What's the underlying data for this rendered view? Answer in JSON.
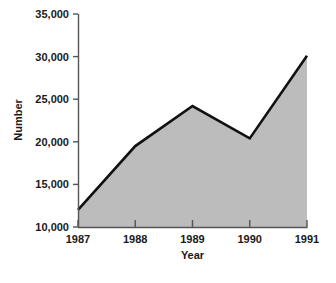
{
  "chart_data": {
    "type": "area",
    "title": "",
    "subtitle": "",
    "xlabel": "Year",
    "ylabel": "Number",
    "categories": [
      "1987",
      "1988",
      "1989",
      "1990",
      "1991"
    ],
    "x": [
      1987,
      1988,
      1989,
      1990,
      1991
    ],
    "values": [
      12000,
      19500,
      24200,
      20400,
      30100
    ],
    "series": [
      {
        "name": "Number",
        "values": [
          12000,
          19500,
          24200,
          20400,
          30100
        ]
      }
    ],
    "xlim": [
      1987,
      1991
    ],
    "ylim": [
      10000,
      35000
    ],
    "y_ticks": [
      10000,
      15000,
      20000,
      25000,
      30000,
      35000
    ],
    "y_tick_labels": [
      "10,000",
      "15,000",
      "20,000",
      "25,000",
      "30,000",
      "35,000"
    ],
    "x_ticks": [
      1987,
      1988,
      1989,
      1990,
      1991
    ],
    "x_tick_labels": [
      "1987",
      "1988",
      "1989",
      "1990",
      "1991"
    ],
    "grid": false,
    "legend": null,
    "legend_position": "none",
    "annotations": [],
    "colors": {
      "area_fill": "#bcbcbc",
      "line": "#111111",
      "axis": "#555555",
      "text": "#1a1a1a",
      "background": "#ffffff"
    }
  },
  "axes": {
    "y_title": "Number",
    "x_title": "Year"
  }
}
